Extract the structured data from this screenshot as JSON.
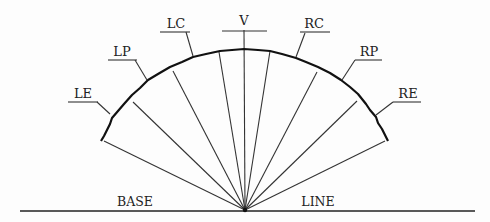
{
  "diagram": {
    "type": "fan / visual-field diagram",
    "origin": {
      "x": 245,
      "y": 210
    },
    "baseline": {
      "left_label": "BASE",
      "right_label": "LINE",
      "x1": 20,
      "x2": 475,
      "y": 211
    },
    "spokes": [
      {
        "id": "left-edge",
        "x": 104,
        "y": 141
      },
      {
        "id": "left-2",
        "x": 133,
        "y": 102
      },
      {
        "id": "left-3",
        "x": 173,
        "y": 71
      },
      {
        "id": "left-4",
        "x": 219,
        "y": 52
      },
      {
        "id": "vertical",
        "x": 244,
        "y": 30
      },
      {
        "id": "right-4",
        "x": 270,
        "y": 51
      },
      {
        "id": "right-3",
        "x": 317,
        "y": 72
      },
      {
        "id": "right-2",
        "x": 357,
        "y": 101
      },
      {
        "id": "right-edge",
        "x": 385,
        "y": 141
      }
    ],
    "arc_points": "101,141 104,136 106,132 110,124 112,118 118,111 124,104 132,95 140,88 148,80 158,74 170,67 182,62 193,57 206,54 220,51 232,50 244,49 258,50 270,51 282,54 296,58 306,62 318,67 330,73 341,80 350,87 358,94 366,104 370,110 376,117 378,123 382,129 386,137 388,141",
    "labels": [
      {
        "id": "LE",
        "text": "LE",
        "x": 83,
        "y": 98,
        "ul": [
          68,
          102,
          98,
          102
        ],
        "leader": [
          97,
          102,
          110,
          114
        ]
      },
      {
        "id": "LP",
        "text": "LP",
        "x": 122,
        "y": 56,
        "ul": [
          108,
          60,
          137,
          60
        ],
        "leader": [
          135,
          60,
          147,
          80
        ]
      },
      {
        "id": "LC",
        "text": "LC",
        "x": 176,
        "y": 28,
        "ul": [
          160,
          32,
          190,
          32
        ],
        "leader": [
          186,
          32,
          193,
          56
        ]
      },
      {
        "id": "V",
        "text": "V",
        "x": 244,
        "y": 25,
        "ul": [
          222,
          31,
          267,
          31
        ],
        "leader": null
      },
      {
        "id": "RC",
        "text": "RC",
        "x": 314,
        "y": 28,
        "ul": [
          300,
          32,
          330,
          32
        ],
        "leader": [
          305,
          33,
          296,
          57
        ]
      },
      {
        "id": "RP",
        "text": "RP",
        "x": 369,
        "y": 56,
        "ul": [
          355,
          60,
          382,
          60
        ],
        "leader": [
          355,
          60,
          342,
          80
        ]
      },
      {
        "id": "RE",
        "text": "RE",
        "x": 408,
        "y": 98,
        "ul": [
          393,
          102,
          421,
          102
        ],
        "leader": [
          393,
          102,
          376,
          115
        ]
      }
    ]
  }
}
